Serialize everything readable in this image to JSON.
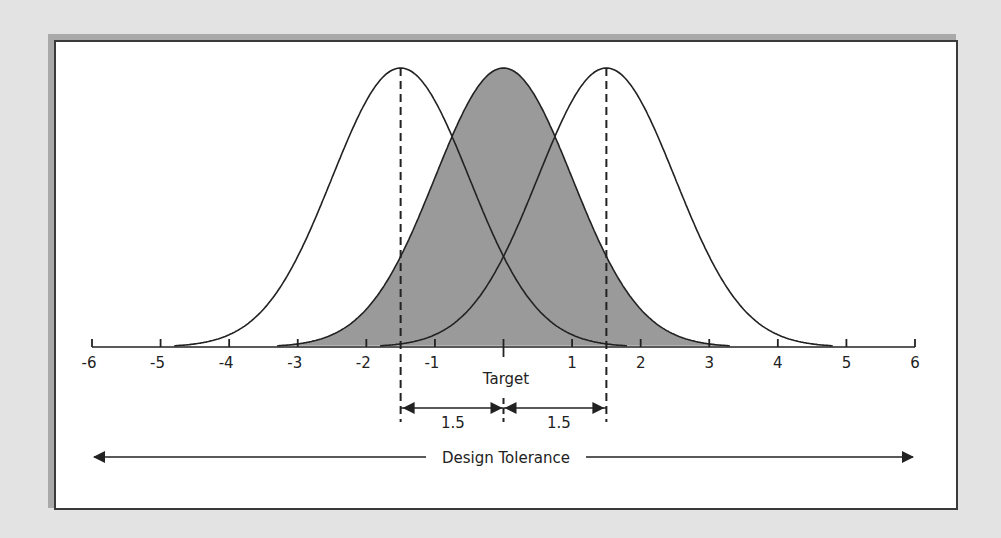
{
  "chart_data": {
    "type": "diagram",
    "title": "",
    "xaxis": {
      "min": -6,
      "max": 6,
      "ticks": [
        -6,
        -5,
        -4,
        -3,
        -2,
        -1,
        0,
        1,
        2,
        3,
        4,
        5,
        6
      ],
      "tick_labels": [
        "-6",
        "-5",
        "-4",
        "-3",
        "-2",
        "-1",
        "",
        "1",
        "2",
        "3",
        "4",
        "5",
        "6"
      ]
    },
    "curves": [
      {
        "name": "shifted-left",
        "mean": -1.5,
        "sigma": 1.0,
        "filled": false
      },
      {
        "name": "centered",
        "mean": 0,
        "sigma": 1.0,
        "filled": true,
        "fill": "#9a9a9a"
      },
      {
        "name": "shifted-right",
        "mean": 1.5,
        "sigma": 1.0,
        "filled": false
      }
    ],
    "annotations": {
      "target_label": "Target",
      "left_shift_label": "1.5",
      "right_shift_label": "1.5",
      "tolerance_label": "Design Tolerance"
    }
  },
  "colors": {
    "background": "#e3e3e3",
    "fill": "#9a9a9a",
    "line": "#222222"
  }
}
